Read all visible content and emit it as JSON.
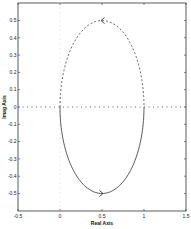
{
  "chart_data": {
    "type": "line",
    "title": "",
    "xlabel": "Real Axis",
    "ylabel": "Imag Axis",
    "xlim": [
      -0.5,
      1.5
    ],
    "ylim": [
      -0.6,
      0.6
    ],
    "xticks": [
      "-0.5",
      "0",
      "0.5",
      "1",
      "1.5"
    ],
    "yticks": [
      "0.5",
      "0.4",
      "0.3",
      "0.2",
      "0.1",
      "0",
      "-0.1",
      "-0.2",
      "-0.3",
      "-0.4",
      "-0.5"
    ],
    "grid": false,
    "legend": null,
    "series": [
      {
        "name": "positive frequencies",
        "style": "solid",
        "description": "lower half of circle centered at (0.5, 0), radius 0.5",
        "x": [
          0,
          0.067,
          0.25,
          0.5,
          0.75,
          0.933,
          1
        ],
        "y": [
          0,
          -0.25,
          -0.433,
          -0.5,
          -0.433,
          -0.25,
          0
        ]
      },
      {
        "name": "negative frequencies",
        "style": "dashed",
        "description": "upper half of circle centered at (0.5, 0), radius 0.5",
        "x": [
          0,
          0.067,
          0.25,
          0.5,
          0.75,
          0.933,
          1
        ],
        "y": [
          0,
          0.25,
          0.433,
          0.5,
          0.433,
          0.25,
          0
        ]
      },
      {
        "name": "real axis",
        "style": "dotted",
        "x": [
          -0.5,
          1.5
        ],
        "y": [
          0,
          0
        ]
      }
    ],
    "annotations": [
      {
        "type": "arrow",
        "x": 0.5,
        "y": 0.5,
        "direction": "left"
      },
      {
        "type": "arrow",
        "x": 0.5,
        "y": -0.5,
        "direction": "right"
      }
    ]
  },
  "labels": {
    "xlabel": "Real Axis",
    "ylabel": "Imag Axis"
  }
}
